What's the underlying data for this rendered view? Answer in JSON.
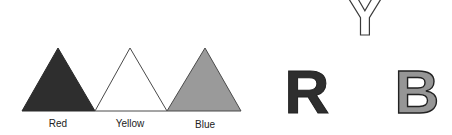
{
  "figure": {
    "triangles": [
      {
        "name": "red",
        "label": "Red",
        "fill": "#2e2e2e",
        "stroke": "#2a2a2a"
      },
      {
        "name": "yellow",
        "label": "Yellow",
        "fill": "#ffffff",
        "stroke": "#4a4a4a"
      },
      {
        "name": "blue",
        "label": "Blue",
        "fill": "#9a9a9a",
        "stroke": "#4a4a4a"
      }
    ],
    "letters": [
      {
        "name": "Y",
        "char": "Y",
        "fill": "#ffffff",
        "stroke": "#3a3a3a"
      },
      {
        "name": "R",
        "char": "R",
        "fill": "#2e2e2e",
        "stroke": "#222222"
      },
      {
        "name": "B",
        "char": "B",
        "fill": "#969696",
        "stroke": "#222222"
      }
    ]
  }
}
